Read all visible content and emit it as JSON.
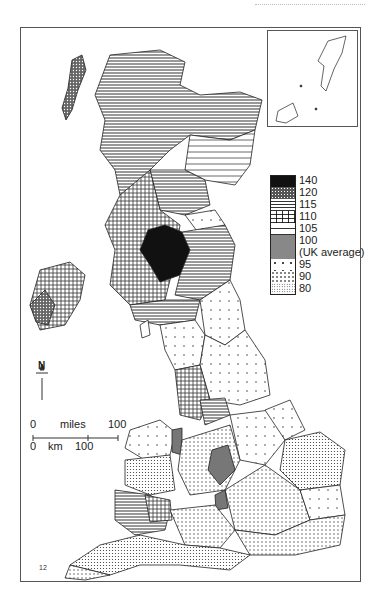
{
  "map": {
    "subject": "Choropleth map of the United Kingdom by region, index relative to UK average",
    "inset_label": "Shetland / Orkney inset",
    "north_label": "N",
    "scale": {
      "miles_zero": "0",
      "miles_label": "miles",
      "miles_max": "100",
      "km_zero": "0",
      "km_label": "km",
      "km_max": "100"
    },
    "footnote_mark": "12"
  },
  "legend": {
    "items": [
      {
        "label": "140",
        "pattern": "solid-black"
      },
      {
        "label": "120",
        "pattern": "dense-dots"
      },
      {
        "label": "115",
        "pattern": "horizontal-lines"
      },
      {
        "label": "110",
        "pattern": "grid"
      },
      {
        "label": "105",
        "pattern": "sparse-horizontal"
      },
      {
        "label": "100",
        "pattern": "grey"
      },
      {
        "label": "(UK average)",
        "pattern": "grey"
      },
      {
        "label": "95",
        "pattern": "sparse-dots"
      },
      {
        "label": "90",
        "pattern": "dots"
      },
      {
        "label": "80",
        "pattern": "fine-dots"
      }
    ]
  }
}
